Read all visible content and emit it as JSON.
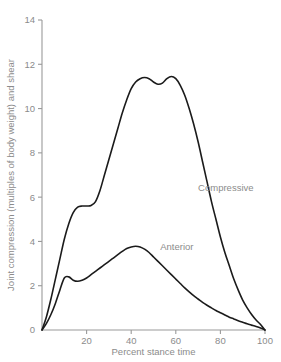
{
  "chart_data": {
    "type": "line",
    "title": "",
    "xlabel": "Percent stance time",
    "ylabel": "Joint compression (multiples of body weight) and shear",
    "xlim": [
      0,
      100
    ],
    "ylim": [
      0,
      14
    ],
    "xticks": [
      20,
      40,
      60,
      80,
      100
    ],
    "yticks": [
      0,
      2,
      4,
      6,
      8,
      10,
      12,
      14
    ],
    "xtick_labels": [
      "20",
      "40",
      "60",
      "80",
      "100"
    ],
    "ytick_labels": [
      "0",
      "2",
      "4",
      "6",
      "8",
      "10",
      "12",
      "14"
    ],
    "grid": false,
    "legend": "inline-annotations",
    "series": [
      {
        "name": "Compressive",
        "annotation": "Compressive",
        "x": [
          0,
          2,
          4,
          6,
          8,
          10,
          12,
          14,
          16,
          18,
          20,
          22,
          24,
          26,
          28,
          30,
          32,
          34,
          36,
          38,
          40,
          42,
          44,
          46,
          48,
          50,
          52,
          54,
          56,
          58,
          60,
          62,
          64,
          66,
          68,
          70,
          72,
          74,
          76,
          78,
          80,
          82,
          84,
          86,
          88,
          90,
          92,
          94,
          96,
          98,
          100
        ],
        "y": [
          0,
          0.6,
          1.4,
          2.3,
          3.2,
          4.1,
          4.8,
          5.3,
          5.55,
          5.6,
          5.6,
          5.62,
          5.8,
          6.3,
          7.0,
          7.7,
          8.4,
          9.1,
          9.8,
          10.4,
          10.9,
          11.2,
          11.35,
          11.4,
          11.35,
          11.2,
          11.1,
          11.15,
          11.35,
          11.45,
          11.35,
          11.05,
          10.6,
          10.0,
          9.3,
          8.5,
          7.6,
          6.7,
          5.8,
          5.0,
          4.2,
          3.5,
          2.9,
          2.3,
          1.8,
          1.35,
          1.0,
          0.7,
          0.45,
          0.25,
          0
        ]
      },
      {
        "name": "Anterior",
        "annotation": "Anterior",
        "x": [
          0,
          2,
          4,
          6,
          8,
          10,
          12,
          14,
          16,
          18,
          20,
          22,
          24,
          26,
          28,
          30,
          32,
          34,
          36,
          38,
          40,
          42,
          44,
          46,
          48,
          50,
          52,
          54,
          56,
          58,
          60,
          62,
          64,
          66,
          68,
          70,
          72,
          74,
          76,
          78,
          80,
          82,
          84,
          86,
          88,
          90,
          92,
          94,
          96,
          98,
          100
        ],
        "y": [
          0,
          0.3,
          0.7,
          1.2,
          1.8,
          2.35,
          2.4,
          2.25,
          2.2,
          2.25,
          2.35,
          2.5,
          2.65,
          2.8,
          2.95,
          3.1,
          3.25,
          3.4,
          3.55,
          3.68,
          3.75,
          3.78,
          3.75,
          3.65,
          3.5,
          3.3,
          3.1,
          2.9,
          2.7,
          2.5,
          2.3,
          2.1,
          1.9,
          1.72,
          1.55,
          1.4,
          1.25,
          1.12,
          1.0,
          0.88,
          0.78,
          0.68,
          0.58,
          0.5,
          0.42,
          0.35,
          0.28,
          0.22,
          0.16,
          0.09,
          0
        ]
      }
    ],
    "annotations": [
      {
        "text": "Compressive",
        "x_pct": 70,
        "y_value": 6.3
      },
      {
        "text": "Anterior",
        "x_pct": 53,
        "y_value": 3.6
      }
    ],
    "colors": {
      "line": "#1b1b1b",
      "axis": "#9a9a9a",
      "text": "#8b8b8b",
      "background": "#ffffff"
    }
  }
}
